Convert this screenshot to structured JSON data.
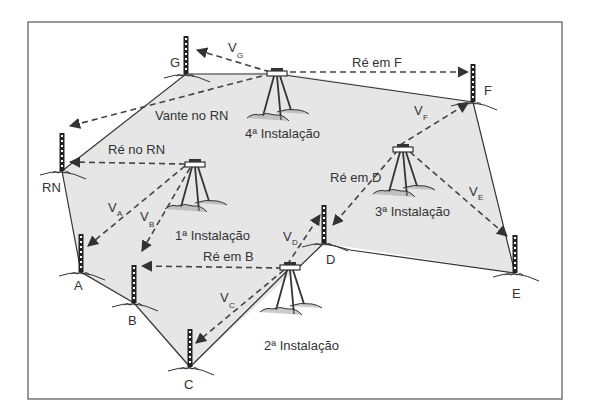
{
  "diagram": {
    "type": "leveling-traverse",
    "colors": {
      "frame": "#777777",
      "fill": "#e6e6e6",
      "line": "#333333",
      "dash": "#444444",
      "text": "#333333"
    },
    "frame": {
      "x": 28,
      "y": 22,
      "w": 534,
      "h": 377
    },
    "points": [
      {
        "id": "G",
        "label": "G",
        "x": 186,
        "y": 74
      },
      {
        "id": "RN",
        "label": "RN",
        "x": 62,
        "y": 171
      },
      {
        "id": "A",
        "label": "A",
        "x": 81,
        "y": 272
      },
      {
        "id": "B",
        "label": "B",
        "x": 134,
        "y": 303
      },
      {
        "id": "C",
        "label": "C",
        "x": 190,
        "y": 367
      },
      {
        "id": "D",
        "label": "D",
        "x": 324,
        "y": 243
      },
      {
        "id": "E",
        "label": "E",
        "x": 515,
        "y": 273
      },
      {
        "id": "F",
        "label": "F",
        "x": 473,
        "y": 102
      }
    ],
    "instalacoes": [
      {
        "id": "i1",
        "label": "1ª Instalação",
        "x": 195,
        "y": 165
      },
      {
        "id": "i2",
        "label": "2ª Instalação",
        "x": 290,
        "y": 268
      },
      {
        "id": "i3",
        "label": "3ª Instalação",
        "x": 403,
        "y": 148
      },
      {
        "id": "i4",
        "label": "4ª Instalação",
        "x": 277,
        "y": 72
      }
    ],
    "labels": {
      "vante_rn": "Vante no RN",
      "re_rn": "Ré no RN",
      "re_b": "Ré em B",
      "re_d": "Ré em D",
      "re_f": "Ré em F",
      "va": "V",
      "va_sub": "A",
      "vb": "V",
      "vb_sub": "B",
      "vc": "V",
      "vc_sub": "C",
      "vd": "V",
      "vd_sub": "D",
      "ve": "V",
      "ve_sub": "E",
      "vf": "V",
      "vf_sub": "F",
      "vg": "V",
      "vg_sub": "G"
    }
  }
}
